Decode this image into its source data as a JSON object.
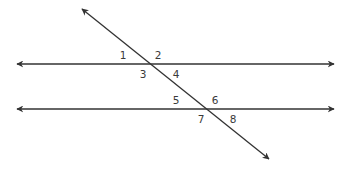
{
  "diagram": {
    "type": "parallel-lines-cut-by-transversal",
    "colors": {
      "line": "#333333",
      "label": "#3a3a3a",
      "background": "#ffffff"
    },
    "lines": {
      "parallel_top": {
        "x1": 17,
        "y1": 64,
        "x2": 334,
        "y2": 64
      },
      "parallel_bottom": {
        "x1": 17,
        "y1": 109,
        "x2": 334,
        "y2": 109
      },
      "transversal": {
        "x1": 82,
        "y1": 9,
        "x2": 269,
        "y2": 159
      }
    },
    "intersections": [
      {
        "name": "top",
        "x": 150.6,
        "y": 64
      },
      {
        "name": "bottom",
        "x": 206.7,
        "y": 109
      }
    ],
    "angle_labels": [
      {
        "id": "1",
        "text": "1",
        "x": 123,
        "y": 55
      },
      {
        "id": "2",
        "text": "2",
        "x": 158,
        "y": 55
      },
      {
        "id": "3",
        "text": "3",
        "x": 143,
        "y": 74
      },
      {
        "id": "4",
        "text": "4",
        "x": 176,
        "y": 74
      },
      {
        "id": "5",
        "text": "5",
        "x": 176,
        "y": 100
      },
      {
        "id": "6",
        "text": "6",
        "x": 215,
        "y": 100
      },
      {
        "id": "7",
        "text": "7",
        "x": 201,
        "y": 119
      },
      {
        "id": "8",
        "text": "8",
        "x": 233,
        "y": 119
      }
    ]
  }
}
